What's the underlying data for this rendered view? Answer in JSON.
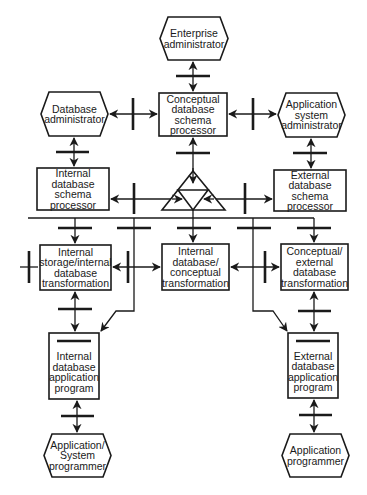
{
  "diagram": {
    "colors": {
      "stroke": "#1a1a1a",
      "fill": "#ffffff",
      "background": "#ffffff"
    },
    "nodes": [
      {
        "id": "enterprise-admin",
        "type": "hexagon",
        "label": "Enterprise\nadministrator",
        "x": 160,
        "y": 17,
        "w": 68,
        "h": 43
      },
      {
        "id": "database-admin",
        "type": "hexagon",
        "label": "Database\nadministrator",
        "x": 41,
        "y": 92,
        "w": 67,
        "h": 44
      },
      {
        "id": "conceptual-schema-processor",
        "type": "box",
        "label": "Conceptual\ndatabase\nschema\nprocessor",
        "x": 159,
        "y": 93,
        "w": 68,
        "h": 43
      },
      {
        "id": "app-system-admin",
        "type": "hexagon",
        "label": "Application\nsystem\nadministrator",
        "x": 278,
        "y": 93,
        "w": 67,
        "h": 44
      },
      {
        "id": "internal-schema-processor",
        "type": "box",
        "label": "Internal\ndatabase\nschema\nprocessor",
        "x": 37,
        "y": 168,
        "w": 72,
        "h": 42
      },
      {
        "id": "external-schema-processor",
        "type": "box",
        "label": "External\ndatabase\nschema\nprocessor",
        "x": 274,
        "y": 170,
        "w": 72,
        "h": 41
      },
      {
        "id": "internal-storage-transformation",
        "type": "box",
        "label": "Internal\nstorage/internal\ndatabase\ntransformation",
        "x": 40,
        "y": 245,
        "w": 71,
        "h": 45
      },
      {
        "id": "internal-conceptual-transformation",
        "type": "box",
        "label": "Internal\ndatabase/\nconceptual\ntransformation",
        "x": 162,
        "y": 244,
        "w": 67,
        "h": 46
      },
      {
        "id": "conceptual-external-transformation",
        "type": "box",
        "label": "Conceptual/\nexternal\ndatabase\ntransformation",
        "x": 281,
        "y": 244,
        "w": 67,
        "h": 46
      },
      {
        "id": "internal-app-program",
        "type": "box",
        "label": "Internal\ndatabase\napplication\nprogram",
        "x": 49,
        "y": 333,
        "w": 50,
        "h": 66,
        "bar": true
      },
      {
        "id": "external-app-program",
        "type": "box",
        "label": "External\ndatabase\napplication\nprogram",
        "x": 288,
        "y": 333,
        "w": 50,
        "h": 65,
        "bar": true
      },
      {
        "id": "app-system-programmer",
        "type": "hexagon",
        "label": "Application/\nSystem\nprogrammer",
        "x": 44,
        "y": 434,
        "w": 67,
        "h": 43
      },
      {
        "id": "app-programmer",
        "type": "hexagon",
        "label": "Application\nprogrammer",
        "x": 282,
        "y": 434,
        "w": 67,
        "h": 43
      }
    ],
    "hub": {
      "id": "schema-triangle",
      "apex": [
        193,
        171
      ],
      "base_y": 210,
      "left_x": 162,
      "right_x": 225,
      "inner_y": 190
    }
  }
}
